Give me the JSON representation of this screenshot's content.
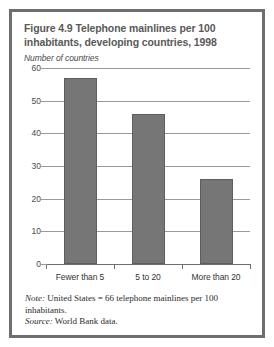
{
  "figure": {
    "title": "Figure 4.9  Telephone mainlines per 100 inhabitants, developing countries, 1998",
    "axis_caption": "Number of countries",
    "note_lead": "Note:",
    "note_text": " United States = 66 telephone mainlines per 100 inhabitants.",
    "source_lead": "Source:",
    "source_text": " World Bank data.",
    "colors": {
      "bar_fill": "#767676",
      "bar_stroke": "#5e5e5e",
      "frame": "#6e6e6e",
      "gridline": "#9a9a9a",
      "title_text": "#595959",
      "body_text": "#2b2b2b",
      "background": "#ffffff"
    }
  },
  "chart_data": {
    "type": "bar",
    "title": "Figure 4.9  Telephone mainlines per 100 inhabitants, developing countries, 1998",
    "subtitle": "Number of countries",
    "xlabel": "",
    "ylabel": "Number of countries",
    "categories": [
      "Fewer than 5",
      "5 to 20",
      "More than 20"
    ],
    "values": [
      57,
      46,
      26
    ],
    "yticks": [
      0,
      10,
      20,
      30,
      40,
      50,
      60
    ],
    "ylim": [
      0,
      60
    ],
    "grid": true,
    "legend": false,
    "series": [
      {
        "name": "Number of countries",
        "values": [
          57,
          46,
          26
        ]
      }
    ]
  }
}
